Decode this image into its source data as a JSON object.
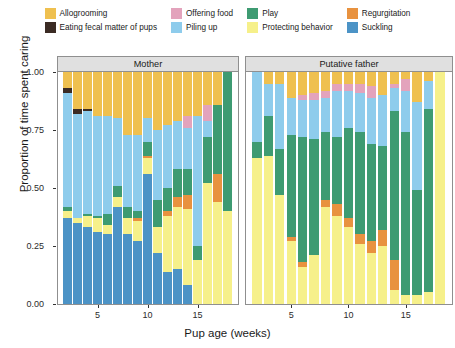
{
  "chart_data": {
    "type": "bar",
    "stacked": true,
    "normalized": true,
    "title": "",
    "xlabel": "Pup age (weeks)",
    "ylabel": "Proportion of time spent caring",
    "ylim": [
      0,
      1
    ],
    "ytick_labels": [
      "0.00",
      "0.25",
      "0.50",
      "0.75",
      "1.00"
    ],
    "ytick_values": [
      0,
      0.25,
      0.5,
      0.75,
      1
    ],
    "xtick_labels": [
      "5",
      "10",
      "15"
    ],
    "xtick_values": [
      5,
      10,
      15
    ],
    "grid": false,
    "legend_position": "top",
    "panels": [
      {
        "label": "Mother",
        "x": [
          2,
          3,
          4,
          5,
          6,
          7,
          8,
          9,
          10,
          11,
          12,
          13,
          14,
          15,
          16,
          17,
          18
        ],
        "series_order": [
          "Suckling",
          "Protecting behavior",
          "Regurgitation",
          "Play",
          "Piling up",
          "Eating fecal matter of pups",
          "Offering food",
          "Allogrooming"
        ],
        "stacks": [
          {
            "Suckling": 0.37,
            "Protecting behavior": 0.03,
            "Regurgitation": 0.0,
            "Play": 0.02,
            "Piling up": 0.49,
            "Eating fecal matter of pups": 0.02,
            "Offering food": 0.0,
            "Allogrooming": 0.07
          },
          {
            "Suckling": 0.35,
            "Protecting behavior": 0.02,
            "Regurgitation": 0.0,
            "Play": 0.0,
            "Piling up": 0.45,
            "Eating fecal matter of pups": 0.02,
            "Offering food": 0.0,
            "Allogrooming": 0.16
          },
          {
            "Suckling": 0.33,
            "Protecting behavior": 0.05,
            "Regurgitation": 0.0,
            "Play": 0.01,
            "Piling up": 0.44,
            "Eating fecal matter of pups": 0.01,
            "Offering food": 0.0,
            "Allogrooming": 0.16
          },
          {
            "Suckling": 0.31,
            "Protecting behavior": 0.06,
            "Regurgitation": 0.0,
            "Play": 0.01,
            "Piling up": 0.43,
            "Eating fecal matter of pups": 0.0,
            "Offering food": 0.0,
            "Allogrooming": 0.19
          },
          {
            "Suckling": 0.3,
            "Protecting behavior": 0.04,
            "Regurgitation": 0.0,
            "Play": 0.05,
            "Piling up": 0.42,
            "Eating fecal matter of pups": 0.0,
            "Offering food": 0.0,
            "Allogrooming": 0.19
          },
          {
            "Suckling": 0.42,
            "Protecting behavior": 0.04,
            "Regurgitation": 0.0,
            "Play": 0.05,
            "Piling up": 0.29,
            "Eating fecal matter of pups": 0.0,
            "Offering food": 0.0,
            "Allogrooming": 0.2
          },
          {
            "Suckling": 0.3,
            "Protecting behavior": 0.07,
            "Regurgitation": 0.0,
            "Play": 0.05,
            "Piling up": 0.31,
            "Eating fecal matter of pups": 0.0,
            "Offering food": 0.0,
            "Allogrooming": 0.27
          },
          {
            "Suckling": 0.27,
            "Protecting behavior": 0.09,
            "Regurgitation": 0.01,
            "Play": 0.03,
            "Piling up": 0.33,
            "Eating fecal matter of pups": 0.0,
            "Offering food": 0.0,
            "Allogrooming": 0.27
          },
          {
            "Suckling": 0.56,
            "Protecting behavior": 0.07,
            "Regurgitation": 0.01,
            "Play": 0.06,
            "Piling up": 0.1,
            "Eating fecal matter of pups": 0.0,
            "Offering food": 0.0,
            "Allogrooming": 0.2
          },
          {
            "Suckling": 0.22,
            "Protecting behavior": 0.11,
            "Regurgitation": 0.0,
            "Play": 0.12,
            "Piling up": 0.3,
            "Eating fecal matter of pups": 0.0,
            "Offering food": 0.0,
            "Allogrooming": 0.25
          },
          {
            "Suckling": 0.14,
            "Protecting behavior": 0.24,
            "Regurgitation": 0.02,
            "Play": 0.1,
            "Piling up": 0.27,
            "Eating fecal matter of pups": 0.0,
            "Offering food": 0.0,
            "Allogrooming": 0.23
          },
          {
            "Suckling": 0.15,
            "Protecting behavior": 0.27,
            "Regurgitation": 0.04,
            "Play": 0.12,
            "Piling up": 0.21,
            "Eating fecal matter of pups": 0.0,
            "Offering food": 0.0,
            "Allogrooming": 0.21
          },
          {
            "Suckling": 0.08,
            "Protecting behavior": 0.33,
            "Regurgitation": 0.06,
            "Play": 0.11,
            "Piling up": 0.18,
            "Eating fecal matter of pups": 0.0,
            "Offering food": 0.05,
            "Allogrooming": 0.19
          },
          {
            "Suckling": 0.0,
            "Protecting behavior": 0.19,
            "Regurgitation": 0.0,
            "Play": 0.06,
            "Piling up": 0.56,
            "Eating fecal matter of pups": 0.0,
            "Offering food": 0.0,
            "Allogrooming": 0.19
          },
          {
            "Suckling": 0.0,
            "Protecting behavior": 0.52,
            "Regurgitation": 0.0,
            "Play": 0.2,
            "Piling up": 0.07,
            "Eating fecal matter of pups": 0.0,
            "Offering food": 0.07,
            "Allogrooming": 0.14
          },
          {
            "Suckling": 0.0,
            "Protecting behavior": 0.44,
            "Regurgitation": 0.12,
            "Play": 0.3,
            "Piling up": 0.0,
            "Eating fecal matter of pups": 0.0,
            "Offering food": 0.0,
            "Allogrooming": 0.14
          },
          {
            "Suckling": 0.0,
            "Protecting behavior": 0.4,
            "Regurgitation": 0.0,
            "Play": 0.6,
            "Piling up": 0.0,
            "Eating fecal matter of pups": 0.0,
            "Offering food": 0.0,
            "Allogrooming": 0.0
          }
        ]
      },
      {
        "label": "Putative father",
        "x": [
          2,
          3,
          4,
          5,
          6,
          7,
          8,
          9,
          10,
          11,
          12,
          13,
          14,
          15,
          16,
          17,
          18
        ],
        "series_order": [
          "Suckling",
          "Protecting behavior",
          "Regurgitation",
          "Play",
          "Piling up",
          "Eating fecal matter of pups",
          "Offering food",
          "Allogrooming"
        ],
        "stacks": [
          {
            "Suckling": 0.0,
            "Protecting behavior": 0.63,
            "Regurgitation": 0.0,
            "Play": 0.07,
            "Piling up": 0.3,
            "Eating fecal matter of pups": 0.0,
            "Offering food": 0.0,
            "Allogrooming": 0.0
          },
          {
            "Suckling": 0.0,
            "Protecting behavior": 0.64,
            "Regurgitation": 0.0,
            "Play": 0.17,
            "Piling up": 0.14,
            "Eating fecal matter of pups": 0.0,
            "Offering food": 0.0,
            "Allogrooming": 0.05
          },
          {
            "Suckling": 0.0,
            "Protecting behavior": 0.47,
            "Regurgitation": 0.0,
            "Play": 0.2,
            "Piling up": 0.28,
            "Eating fecal matter of pups": 0.0,
            "Offering food": 0.0,
            "Allogrooming": 0.05
          },
          {
            "Suckling": 0.0,
            "Protecting behavior": 0.27,
            "Regurgitation": 0.02,
            "Play": 0.44,
            "Piling up": 0.16,
            "Eating fecal matter of pups": 0.0,
            "Offering food": 0.0,
            "Allogrooming": 0.11
          },
          {
            "Suckling": 0.0,
            "Protecting behavior": 0.16,
            "Regurgitation": 0.02,
            "Play": 0.54,
            "Piling up": 0.16,
            "Eating fecal matter of pups": 0.0,
            "Offering food": 0.02,
            "Allogrooming": 0.1
          },
          {
            "Suckling": 0.0,
            "Protecting behavior": 0.21,
            "Regurgitation": 0.0,
            "Play": 0.5,
            "Piling up": 0.17,
            "Eating fecal matter of pups": 0.0,
            "Offering food": 0.03,
            "Allogrooming": 0.09
          },
          {
            "Suckling": 0.0,
            "Protecting behavior": 0.42,
            "Regurgitation": 0.03,
            "Play": 0.29,
            "Piling up": 0.15,
            "Eating fecal matter of pups": 0.0,
            "Offering food": 0.03,
            "Allogrooming": 0.08
          },
          {
            "Suckling": 0.0,
            "Protecting behavior": 0.38,
            "Regurgitation": 0.05,
            "Play": 0.29,
            "Piling up": 0.2,
            "Eating fecal matter of pups": 0.0,
            "Offering food": 0.03,
            "Allogrooming": 0.05
          },
          {
            "Suckling": 0.0,
            "Protecting behavior": 0.33,
            "Regurgitation": 0.04,
            "Play": 0.39,
            "Piling up": 0.16,
            "Eating fecal matter of pups": 0.0,
            "Offering food": 0.03,
            "Allogrooming": 0.05
          },
          {
            "Suckling": 0.0,
            "Protecting behavior": 0.26,
            "Regurgitation": 0.04,
            "Play": 0.44,
            "Piling up": 0.17,
            "Eating fecal matter of pups": 0.0,
            "Offering food": 0.04,
            "Allogrooming": 0.05
          },
          {
            "Suckling": 0.0,
            "Protecting behavior": 0.22,
            "Regurgitation": 0.05,
            "Play": 0.42,
            "Piling up": 0.2,
            "Eating fecal matter of pups": 0.0,
            "Offering food": 0.05,
            "Allogrooming": 0.06
          },
          {
            "Suckling": 0.0,
            "Protecting behavior": 0.25,
            "Regurgitation": 0.07,
            "Play": 0.36,
            "Piling up": 0.22,
            "Eating fecal matter of pups": 0.0,
            "Offering food": 0.0,
            "Allogrooming": 0.1
          },
          {
            "Suckling": 0.0,
            "Protecting behavior": 0.06,
            "Regurgitation": 0.13,
            "Play": 0.64,
            "Piling up": 0.1,
            "Eating fecal matter of pups": 0.0,
            "Offering food": 0.02,
            "Allogrooming": 0.05
          },
          {
            "Suckling": 0.0,
            "Protecting behavior": 0.04,
            "Regurgitation": 0.0,
            "Play": 0.7,
            "Piling up": 0.18,
            "Eating fecal matter of pups": 0.0,
            "Offering food": 0.05,
            "Allogrooming": 0.03
          },
          {
            "Suckling": 0.0,
            "Protecting behavior": 0.04,
            "Regurgitation": 0.0,
            "Play": 0.45,
            "Piling up": 0.38,
            "Eating fecal matter of pups": 0.0,
            "Offering food": 0.0,
            "Allogrooming": 0.13
          },
          {
            "Suckling": 0.0,
            "Protecting behavior": 0.05,
            "Regurgitation": 0.0,
            "Play": 0.79,
            "Piling up": 0.12,
            "Eating fecal matter of pups": 0.0,
            "Offering food": 0.0,
            "Allogrooming": 0.04
          },
          {
            "Suckling": 0.0,
            "Protecting behavior": 1.0,
            "Regurgitation": 0.0,
            "Play": 0.0,
            "Piling up": 0.0,
            "Eating fecal matter of pups": 0.0,
            "Offering food": 0.0,
            "Allogrooming": 0.0
          }
        ]
      }
    ],
    "legend": [
      {
        "label": "Allogrooming",
        "color": "#EFC04F"
      },
      {
        "label": "Offering food",
        "color": "#E3A3BC"
      },
      {
        "label": "Play",
        "color": "#3E9B72"
      },
      {
        "label": "Regurgitation",
        "color": "#E8923F"
      },
      {
        "label": "Eating fecal matter of pups",
        "color": "#3B2B24"
      },
      {
        "label": "Piling up",
        "color": "#8ECCEC"
      },
      {
        "label": "Protecting behavior",
        "color": "#F6F08A"
      },
      {
        "label": "Suckling",
        "color": "#4C93C6"
      }
    ],
    "colors": {
      "Allogrooming": "#EFC04F",
      "Eating fecal matter of pups": "#3B2B24",
      "Offering food": "#E3A3BC",
      "Piling up": "#8ECCEC",
      "Play": "#3E9B72",
      "Protecting behavior": "#F6F08A",
      "Regurgitation": "#E8923F",
      "Suckling": "#4C93C6",
      "panel_strip": "#E0E0E0",
      "panel_border": "#8F8F8F",
      "background": "#FFFFFF"
    }
  }
}
